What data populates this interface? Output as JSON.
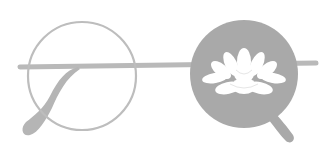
{
  "illustration": {
    "subject": "round eyeglasses with lotus flower in right lens",
    "colors": {
      "background": "#ffffff",
      "frame": "#b9b9b9",
      "temple": "#b5b5b5",
      "lens_fill": "#a9a9a9",
      "lotus": "#ffffff"
    }
  }
}
